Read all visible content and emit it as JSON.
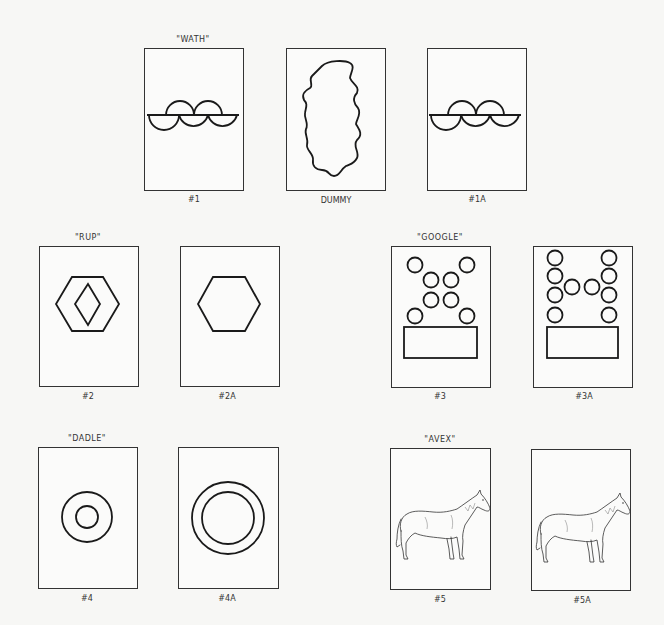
{
  "cards": [
    {
      "id": "1",
      "word": "\"WATH\"",
      "label": "#1",
      "figure": "semicircle-row"
    },
    {
      "id": "dummy",
      "word": "",
      "label": "DUMMY",
      "figure": "wavy-blob"
    },
    {
      "id": "1A",
      "word": "",
      "label": "#1A",
      "figure": "semicircle-row"
    },
    {
      "id": "2",
      "word": "\"RUP\"",
      "label": "#2",
      "figure": "hexagon-with-diamond"
    },
    {
      "id": "2A",
      "word": "",
      "label": "#2A",
      "figure": "hexagon"
    },
    {
      "id": "3",
      "word": "\"GOOGLE\"",
      "label": "#3",
      "figure": "x-of-circles-above-rectangle"
    },
    {
      "id": "3A",
      "word": "",
      "label": "#3A",
      "figure": "h-of-circles-above-rectangle"
    },
    {
      "id": "4",
      "word": "\"DADLE\"",
      "label": "#4",
      "figure": "small-concentric-circles"
    },
    {
      "id": "4A",
      "word": "",
      "label": "#4A",
      "figure": "large-concentric-circles"
    },
    {
      "id": "5",
      "word": "\"AVEX\"",
      "label": "#5",
      "figure": "horse"
    },
    {
      "id": "5A",
      "word": "",
      "label": "#5A",
      "figure": "horse"
    }
  ],
  "colors": {
    "background": "#f7f7f5",
    "line": "#1a1a1a"
  }
}
